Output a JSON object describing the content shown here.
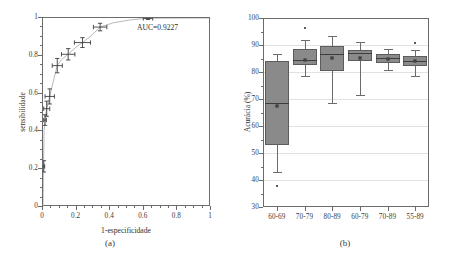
{
  "figure": {
    "panel_a_caption": "(a)",
    "panel_b_caption": "(b)"
  },
  "chart_data": [
    {
      "type": "line",
      "panel": "a",
      "title": "",
      "xlabel": "1-especificidade",
      "ylabel": "sensibilidade",
      "xlim": [
        0,
        1
      ],
      "ylim": [
        0,
        1
      ],
      "xticks": [
        0,
        0.2,
        0.4,
        0.6,
        0.8,
        1
      ],
      "xticklabels": [
        "0",
        "0.2",
        "0.4",
        "0.6",
        "0.8",
        "1"
      ],
      "yticks": [
        0,
        0.2,
        0.4,
        0.6,
        0.8,
        1
      ],
      "yticklabels": [
        "0",
        "0.2",
        "0.4",
        "0.6",
        "0.8",
        "1"
      ],
      "grid": false,
      "legend": "none",
      "annotations": [
        {
          "text": "AUC=0.9227",
          "x": 0.72,
          "y": 0.94
        }
      ],
      "curve": [
        {
          "x": 0.0,
          "y": 0.0
        },
        {
          "x": 0.003,
          "y": 0.215
        },
        {
          "x": 0.006,
          "y": 0.4
        },
        {
          "x": 0.012,
          "y": 0.46
        },
        {
          "x": 0.022,
          "y": 0.52
        },
        {
          "x": 0.04,
          "y": 0.585
        },
        {
          "x": 0.06,
          "y": 0.66
        },
        {
          "x": 0.085,
          "y": 0.748
        },
        {
          "x": 0.11,
          "y": 0.78
        },
        {
          "x": 0.15,
          "y": 0.808
        },
        {
          "x": 0.195,
          "y": 0.845
        },
        {
          "x": 0.235,
          "y": 0.87
        },
        {
          "x": 0.285,
          "y": 0.905
        },
        {
          "x": 0.34,
          "y": 0.952
        },
        {
          "x": 0.42,
          "y": 0.975
        },
        {
          "x": 0.52,
          "y": 0.99
        },
        {
          "x": 0.62,
          "y": 0.999
        },
        {
          "x": 1.0,
          "y": 1.0
        }
      ],
      "points": [
        {
          "x": 0.005,
          "y": 0.215,
          "xerr": 0.005,
          "yerr": 0.03
        },
        {
          "x": 0.012,
          "y": 0.46,
          "xerr": 0.008,
          "yerr": 0.028
        },
        {
          "x": 0.022,
          "y": 0.52,
          "xerr": 0.018,
          "yerr": 0.04
        },
        {
          "x": 0.04,
          "y": 0.585,
          "xerr": 0.028,
          "yerr": 0.04
        },
        {
          "x": 0.085,
          "y": 0.748,
          "xerr": 0.03,
          "yerr": 0.038
        },
        {
          "x": 0.15,
          "y": 0.808,
          "xerr": 0.04,
          "yerr": 0.03
        },
        {
          "x": 0.235,
          "y": 0.87,
          "xerr": 0.048,
          "yerr": 0.026
        },
        {
          "x": 0.34,
          "y": 0.952,
          "xerr": 0.04,
          "yerr": 0.02
        },
        {
          "x": 0.625,
          "y": 0.998,
          "xerr": 0.028,
          "yerr": 0.006
        }
      ]
    },
    {
      "type": "box",
      "panel": "b",
      "title": "",
      "xlabel": "",
      "ylabel": "Acurácia (%)",
      "ylim": [
        30,
        100
      ],
      "yticks": [
        30,
        40,
        50,
        60,
        70,
        80,
        90,
        100
      ],
      "yticklabels": [
        "30",
        "40",
        "50",
        "60",
        "70",
        "80",
        "90",
        "100"
      ],
      "categories": [
        "60-69",
        "70-79",
        "80-89",
        "60-79",
        "70-89",
        "55-89"
      ],
      "grid": true,
      "legend": "none",
      "boxes": [
        {
          "category": "60-69",
          "whisker_low": 43.0,
          "q1": 52.8,
          "median": 68.4,
          "mean": 67.4,
          "q3": 84.2,
          "whisker_high": 86.8,
          "outliers": [
            37.6
          ]
        },
        {
          "category": "70-79",
          "whisker_low": 78.4,
          "q1": 82.6,
          "median": 84.6,
          "mean": 84.3,
          "q3": 88.4,
          "whisker_high": 91.8,
          "outliers": [
            96.2
          ]
        },
        {
          "category": "80-89",
          "whisker_low": 68.6,
          "q1": 80.4,
          "median": 86.8,
          "mean": 85.2,
          "q3": 89.6,
          "whisker_high": 93.2,
          "outliers": []
        },
        {
          "category": "60-79",
          "whisker_low": 71.4,
          "q1": 84.0,
          "median": 87.0,
          "mean": 85.2,
          "q3": 88.2,
          "whisker_high": 91.0,
          "outliers": []
        },
        {
          "category": "70-89",
          "whisker_low": 80.8,
          "q1": 83.4,
          "median": 85.2,
          "mean": 85.0,
          "q3": 86.8,
          "whisker_high": 88.6,
          "outliers": []
        },
        {
          "category": "55-89",
          "whisker_low": 78.6,
          "q1": 82.4,
          "median": 84.0,
          "mean": 84.2,
          "q3": 86.0,
          "whisker_high": 88.2,
          "outliers": [
            90.6
          ]
        }
      ]
    }
  ]
}
